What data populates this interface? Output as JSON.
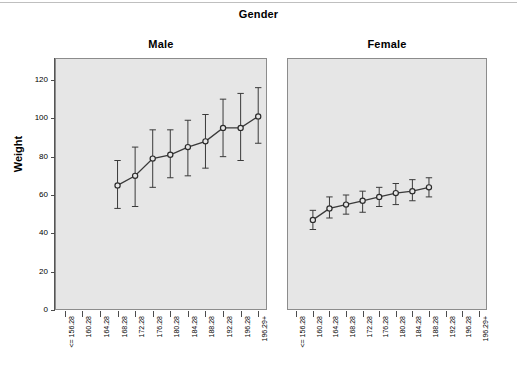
{
  "chart_title": "Gender",
  "axis": {
    "ylabel": "Weight",
    "yticks": [
      "0",
      "20",
      "40",
      "60",
      "80",
      "100",
      "120"
    ],
    "ylim": [
      0,
      130
    ]
  },
  "panels": [
    {
      "name": "male-panel",
      "label": "Male"
    },
    {
      "name": "female-panel",
      "label": "Female"
    }
  ],
  "categories": [
    "<= 156.28",
    "160.28",
    "164.28",
    "168.28",
    "172.28",
    "176.28",
    "180.28",
    "184.28",
    "188.28",
    "192.28",
    "196.28",
    "196.29+"
  ],
  "colors": {
    "panel_background": "#e6e6e6",
    "panel_border": "#8c8c8c",
    "line": "#3a3a3a",
    "marker_fill": "#e6e6e6",
    "marker_stroke": "#2b2b2b",
    "text": "#000000"
  },
  "chart_data": {
    "type": "line",
    "title": "Gender",
    "xlabel": "",
    "ylabel": "Weight",
    "ylim": [
      0,
      130
    ],
    "grid": false,
    "legend": "none",
    "error_bars": "95% CI",
    "panel_variable": "Gender",
    "categories": [
      "<= 156.28",
      "160.28",
      "164.28",
      "168.28",
      "172.28",
      "176.28",
      "180.28",
      "184.28",
      "188.28",
      "192.28",
      "196.28",
      "196.29+"
    ],
    "series": [
      {
        "name": "Male",
        "panel": "Male",
        "points": [
          {
            "category": "168.28",
            "value": 65,
            "lower": 53,
            "upper": 78
          },
          {
            "category": "172.28",
            "value": 70,
            "lower": 54,
            "upper": 85
          },
          {
            "category": "176.28",
            "value": 79,
            "lower": 64,
            "upper": 94
          },
          {
            "category": "180.28",
            "value": 81,
            "lower": 69,
            "upper": 94
          },
          {
            "category": "184.28",
            "value": 85,
            "lower": 70,
            "upper": 99
          },
          {
            "category": "188.28",
            "value": 88,
            "lower": 74,
            "upper": 102
          },
          {
            "category": "192.28",
            "value": 95,
            "lower": 80,
            "upper": 110
          },
          {
            "category": "196.28",
            "value": 95,
            "lower": 78,
            "upper": 113
          },
          {
            "category": "196.29+",
            "value": 101,
            "lower": 87,
            "upper": 116
          }
        ]
      },
      {
        "name": "Female",
        "panel": "Female",
        "points": [
          {
            "category": "160.28",
            "value": 47,
            "lower": 42,
            "upper": 52
          },
          {
            "category": "164.28",
            "value": 53,
            "lower": 48,
            "upper": 59
          },
          {
            "category": "168.28",
            "value": 55,
            "lower": 50,
            "upper": 60
          },
          {
            "category": "172.28",
            "value": 57,
            "lower": 51,
            "upper": 62
          },
          {
            "category": "176.28",
            "value": 59,
            "lower": 54,
            "upper": 64
          },
          {
            "category": "180.28",
            "value": 61,
            "lower": 55,
            "upper": 66
          },
          {
            "category": "184.28",
            "value": 62,
            "lower": 57,
            "upper": 68
          },
          {
            "category": "188.28",
            "value": 64,
            "lower": 59,
            "upper": 69
          }
        ]
      }
    ]
  }
}
